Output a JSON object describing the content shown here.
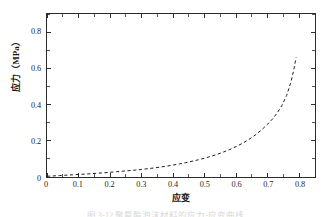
{
  "figure": {
    "caption": "图 3-12    聚氨酯泡沫材料的应力-应变曲线",
    "caption_number": "图",
    "background_color": "#ffffff"
  },
  "chart_data": {
    "type": "line",
    "title": "",
    "subtitle": "",
    "xlabel": "应变",
    "ylabel": "应力（MPa）",
    "xlim": [
      0,
      0.85
    ],
    "ylim": [
      0,
      0.9
    ],
    "xticks": [
      0,
      0.1,
      0.2,
      0.3,
      0.4,
      0.5,
      0.6,
      0.7,
      0.8
    ],
    "xtick_labels": [
      "0",
      "0.1",
      "0.2",
      "0.3",
      "0.4",
      "0.5",
      "0.6",
      "0.7",
      "0.8"
    ],
    "yticks": [
      0,
      0.2,
      0.4,
      0.6,
      0.8
    ],
    "ytick_labels": [
      "0",
      "0.2",
      "0.4",
      "0.6",
      "0.8"
    ],
    "x_minor_tick_interval": 0.05,
    "y_minor_tick_interval": 0.1,
    "grid": false,
    "legend": null,
    "tick_direction": "in",
    "frame": "box",
    "series": [
      {
        "name": "应力-应变曲线",
        "color": "#1a1a1a",
        "linestyle": "dashed",
        "linewidth": 1.0,
        "marker": "none",
        "x": [
          0.0,
          0.02,
          0.04,
          0.06,
          0.08,
          0.1,
          0.12,
          0.14,
          0.16,
          0.18,
          0.2,
          0.22,
          0.24,
          0.26,
          0.28,
          0.3,
          0.32,
          0.34,
          0.36,
          0.38,
          0.4,
          0.42,
          0.44,
          0.46,
          0.48,
          0.5,
          0.52,
          0.54,
          0.56,
          0.58,
          0.6,
          0.62,
          0.64,
          0.66,
          0.68,
          0.7,
          0.715,
          0.73,
          0.745,
          0.76,
          0.772,
          0.782,
          0.79
        ],
        "y": [
          0.004,
          0.006,
          0.008,
          0.01,
          0.012,
          0.014,
          0.016,
          0.018,
          0.021,
          0.023,
          0.026,
          0.029,
          0.032,
          0.035,
          0.038,
          0.042,
          0.046,
          0.05,
          0.055,
          0.06,
          0.066,
          0.072,
          0.079,
          0.087,
          0.095,
          0.104,
          0.114,
          0.125,
          0.138,
          0.152,
          0.168,
          0.186,
          0.207,
          0.231,
          0.259,
          0.292,
          0.32,
          0.353,
          0.395,
          0.45,
          0.515,
          0.585,
          0.66
        ]
      }
    ]
  }
}
